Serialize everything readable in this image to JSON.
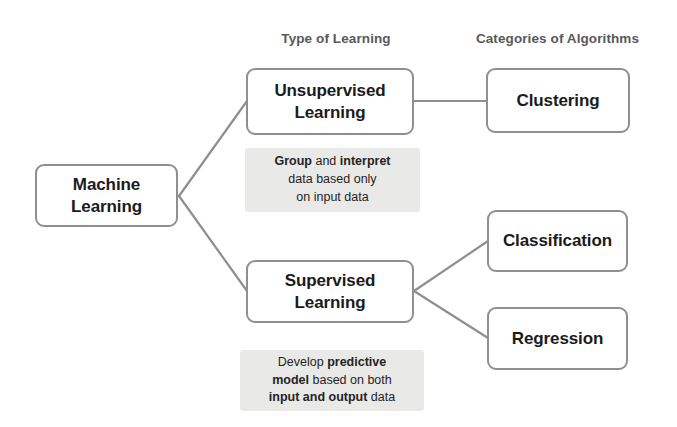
{
  "headers": {
    "type_of_learning": "Type of Learning",
    "categories_of_algorithms": "Categories of Algorithms"
  },
  "nodes": {
    "machine_learning": "Machine Learning",
    "unsupervised_learning": "Unsupervised Learning",
    "supervised_learning": "Supervised Learning",
    "clustering": "Clustering",
    "classification": "Classification",
    "regression": "Regression"
  },
  "notes": {
    "unsupervised": {
      "line1_bold_a": "Group",
      "line1_mid": " and ",
      "line1_bold_b": "interpret",
      "line2": "data based only",
      "line3": "on input data"
    },
    "supervised": {
      "line1_plain": "Develop ",
      "line1_bold": "predictive",
      "line2_bold": "model",
      "line2_plain": " based on both",
      "line3_bold": "input and output",
      "line3_plain": " data"
    }
  },
  "colors": {
    "background": "#ffffff",
    "node_border": "#8e8f91",
    "node_text": "#1b1b1b",
    "header_text": "#58595b",
    "note_background": "#e9e9e7",
    "note_text": "#242424",
    "connector": "#8e8f91"
  },
  "chart_data": {
    "type": "tree-diagram",
    "root": "Machine Learning",
    "columns": [
      "",
      "Type of Learning",
      "Categories of Algorithms"
    ],
    "edges": [
      {
        "from": "Machine Learning",
        "to": "Unsupervised Learning"
      },
      {
        "from": "Machine Learning",
        "to": "Supervised Learning"
      },
      {
        "from": "Unsupervised Learning",
        "to": "Clustering"
      },
      {
        "from": "Supervised Learning",
        "to": "Classification"
      },
      {
        "from": "Supervised Learning",
        "to": "Regression"
      }
    ],
    "annotations": [
      {
        "attached_to": "Unsupervised Learning",
        "text": "Group and interpret data based only on input data"
      },
      {
        "attached_to": "Supervised Learning",
        "text": "Develop predictive model based on both input and output data"
      }
    ]
  }
}
